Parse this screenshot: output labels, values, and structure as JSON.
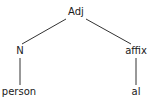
{
  "tree": {
    "root": {
      "label": "Adj"
    },
    "left": {
      "label": "N",
      "leaf": "person"
    },
    "right": {
      "label": "affix",
      "leaf": "al"
    }
  },
  "colors": {
    "line": "#333333",
    "text": "#1a1a1a",
    "background": "#ffffff"
  }
}
